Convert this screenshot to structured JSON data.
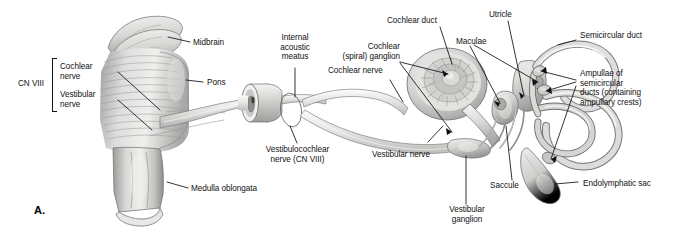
{
  "figure": {
    "panel_letter": "A.",
    "background_color": "#ffffff",
    "ink_color": "#111111",
    "art_tones": {
      "lightest": "#f2f2f1",
      "light": "#dcdcda",
      "mid": "#bdbdbb",
      "dark": "#949492",
      "darkest": "#6e6e6c",
      "outline": "#5a5a58"
    }
  },
  "bracket": {
    "label": "CN VIII",
    "groups": [
      "Cochlear\nnerve",
      "Vestibular\nnerve"
    ]
  },
  "labels": [
    {
      "id": "cn-viii",
      "text": "CN VIII"
    },
    {
      "id": "cochlear-nerve-brainstem",
      "text": "Cochlear\nnerve"
    },
    {
      "id": "vestibular-nerve-brainstem",
      "text": "Vestibular\nnerve"
    },
    {
      "id": "midbrain",
      "text": "Midbrain"
    },
    {
      "id": "pons",
      "text": "Pons"
    },
    {
      "id": "medulla-oblongata",
      "text": "Medulla oblongata"
    },
    {
      "id": "internal-acoustic-meatus",
      "text": "Internal\nacoustic\nmeatus"
    },
    {
      "id": "vestibulocochlear-nerve",
      "text": "Vestibulocochlear\nnerve (CN VIII)"
    },
    {
      "id": "cochlear-nerve",
      "text": "Cochlear nerve"
    },
    {
      "id": "cochlear-spiral-ganglion",
      "text": "Cochlear\n(spiral) ganglion"
    },
    {
      "id": "cochlear-duct",
      "text": "Cochlear duct"
    },
    {
      "id": "maculae",
      "text": "Maculae"
    },
    {
      "id": "utricle",
      "text": "Utricle"
    },
    {
      "id": "semicircular-duct",
      "text": "Semicircular duct"
    },
    {
      "id": "ampullae",
      "text": "Ampullae of\nsemicircular\nducts (containing\nampullary crests)"
    },
    {
      "id": "vestibular-nerve",
      "text": "Vestibular nerve"
    },
    {
      "id": "vestibular-ganglion",
      "text": "Vestibular\nganglion"
    },
    {
      "id": "saccule",
      "text": "Saccule"
    },
    {
      "id": "endolymphatic-sac",
      "text": "Endolymphatic sac"
    }
  ]
}
